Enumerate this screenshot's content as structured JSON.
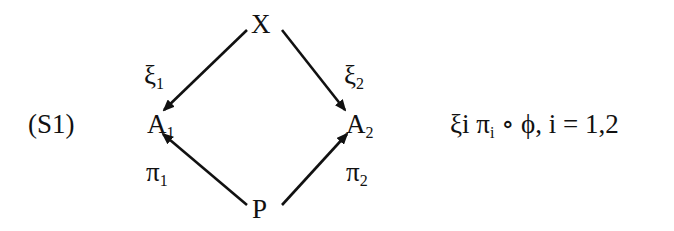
{
  "diagram": {
    "label": "(S1)",
    "nodes": {
      "top": "X",
      "left": {
        "base": "A",
        "sub": "1"
      },
      "right": {
        "base": "A",
        "sub": "2"
      },
      "bottom": "P"
    },
    "edges": {
      "xi1": {
        "base": "ξ",
        "sub": "1"
      },
      "xi2": {
        "base": "ξ",
        "sub": "2"
      },
      "pi1": {
        "base": "π",
        "sub": "1"
      },
      "pi2": {
        "base": "π",
        "sub": "2"
      }
    },
    "condition": {
      "pre": "ξi π",
      "sub": "i",
      "post": " ∘ ϕ, i = 1,2"
    },
    "line_color": "#111111"
  }
}
